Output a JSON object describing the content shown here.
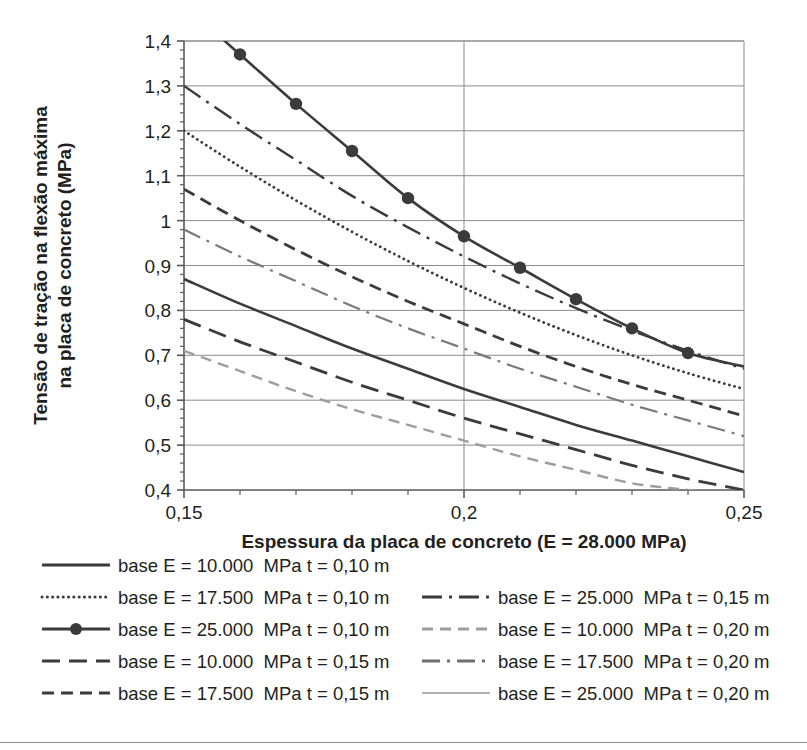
{
  "chart_data": {
    "type": "line",
    "title": "",
    "xlabel": "Espessura da placa de concreto (E = 28.000 MPa)",
    "ylabel": "Tensão de tração na flexão máxima na placa de concreto (MPa)",
    "xlim": [
      0.15,
      0.25
    ],
    "ylim": [
      0.4,
      1.4
    ],
    "xticks": [
      0.15,
      0.2,
      0.25
    ],
    "xtick_labels": [
      "0,15",
      "0,2",
      "0,25"
    ],
    "yticks": [
      0.4,
      0.5,
      0.6,
      0.7,
      0.8,
      0.9,
      1.0,
      1.1,
      1.2,
      1.3,
      1.4
    ],
    "ytick_labels": [
      "0,4",
      "0,5",
      "0,6",
      "0,7",
      "0,8",
      "0,9",
      "1",
      "1,1",
      "1,2",
      "1,3",
      "1,4"
    ],
    "grid": "horizontal-and-major-vertical",
    "legend_position": "below-plot-two-columns",
    "x": [
      0.15,
      0.16,
      0.17,
      0.18,
      0.19,
      0.2,
      0.21,
      0.22,
      0.23,
      0.24,
      0.25
    ],
    "series": [
      {
        "name": "base E = 25.000  MPa t = 0,10 m",
        "style": "solid-marker",
        "color": "#3b3b3b",
        "width": 2.6,
        "markers": true,
        "values": [
          1.48,
          1.37,
          1.26,
          1.155,
          1.05,
          0.965,
          0.895,
          0.825,
          0.76,
          0.705,
          0.675
        ]
      },
      {
        "name": "base E = 25.000  MPa t = 0,15 m",
        "style": "dash-dot",
        "color": "#3b3b3b",
        "width": 2.4,
        "markers": false,
        "values": [
          1.3,
          1.215,
          1.135,
          1.055,
          0.985,
          0.92,
          0.86,
          0.805,
          0.755,
          0.71,
          0.67
        ]
      },
      {
        "name": "base E = 17.500  MPa t = 0,10 m",
        "style": "dotted",
        "color": "#3b3b3b",
        "width": 2.8,
        "markers": false,
        "values": [
          1.2,
          1.12,
          1.045,
          0.975,
          0.91,
          0.85,
          0.795,
          0.745,
          0.7,
          0.66,
          0.625
        ]
      },
      {
        "name": "base E = 17.500  MPa t = 0,15 m",
        "style": "dashed",
        "color": "#3b3b3b",
        "width": 2.8,
        "markers": false,
        "values": [
          1.07,
          1.0,
          0.935,
          0.875,
          0.82,
          0.77,
          0.72,
          0.675,
          0.635,
          0.6,
          0.565
        ]
      },
      {
        "name": "base E = 17.500  MPa t = 0,20 m",
        "style": "dash-dot-light",
        "color": "#7a7a7a",
        "width": 2.2,
        "markers": false,
        "values": [
          0.98,
          0.92,
          0.865,
          0.81,
          0.76,
          0.715,
          0.67,
          0.63,
          0.59,
          0.555,
          0.52
        ]
      },
      {
        "name": "base E = 10.000  MPa t = 0,10 m",
        "style": "solid",
        "color": "#3b3b3b",
        "width": 2.6,
        "markers": false,
        "values": [
          0.87,
          0.815,
          0.765,
          0.715,
          0.67,
          0.625,
          0.585,
          0.545,
          0.51,
          0.475,
          0.44
        ]
      },
      {
        "name": "base E = 10.000  MPa t = 0,15 m",
        "style": "long-dash",
        "color": "#3b3b3b",
        "width": 2.8,
        "markers": false,
        "values": [
          0.78,
          0.73,
          0.685,
          0.64,
          0.6,
          0.56,
          0.525,
          0.49,
          0.455,
          0.425,
          0.4
        ]
      },
      {
        "name": "base E = 10.000  MPa t = 0,20 m",
        "style": "dashed-light",
        "color": "#9d9d9d",
        "width": 2.4,
        "markers": false,
        "values": [
          0.71,
          0.665,
          0.62,
          0.58,
          0.545,
          0.51,
          0.475,
          0.445,
          0.415,
          0.4,
          0.385
        ]
      }
    ]
  },
  "legend": {
    "column_left": [
      {
        "label": "base E = 10.000  MPa t = 0,10 m",
        "style": "solid",
        "color": "#3b3b3b"
      },
      {
        "label": "base E = 17.500  MPa t = 0,10 m",
        "style": "dotted",
        "color": "#3b3b3b"
      },
      {
        "label": "base E = 25.000  MPa t = 0,10 m",
        "style": "solid-marker",
        "color": "#3b3b3b"
      },
      {
        "label": "base E = 10.000  MPa t = 0,15 m",
        "style": "long-dash",
        "color": "#3b3b3b"
      },
      {
        "label": "base E = 17.500  MPa t = 0,15 m",
        "style": "dashed",
        "color": "#3b3b3b"
      }
    ],
    "column_right": [
      {
        "label": "base E = 25.000  MPa t = 0,15 m",
        "style": "dash-dot",
        "color": "#3b3b3b"
      },
      {
        "label": "base E = 10.000  MPa t = 0,20 m",
        "style": "dashed-light",
        "color": "#9d9d9d"
      },
      {
        "label": "base E = 17.500  MPa t = 0,20 m",
        "style": "dash-dot-light",
        "color": "#6f6f6f"
      },
      {
        "label": "base E = 25.000  MPa t = 0,20 m",
        "style": "solid-light",
        "color": "#b3b3b3"
      }
    ]
  },
  "colors": {
    "axis": "#58595b",
    "grid": "#8c8c8c",
    "text": "#231f20",
    "background": "#ffffff"
  }
}
